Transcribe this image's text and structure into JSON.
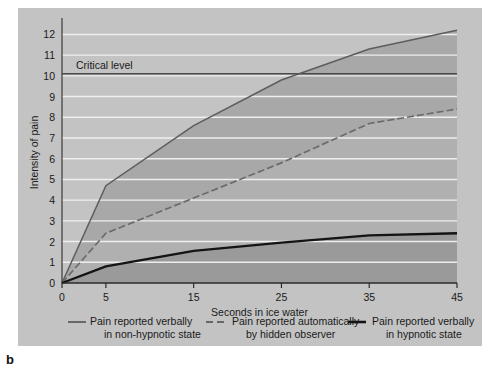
{
  "figure": {
    "panel_label": "b",
    "background_color": "#c3c3c3",
    "page_color": "#ffffff"
  },
  "chart_data": {
    "type": "area",
    "title": "",
    "xlabel": "Seconds in ice water",
    "ylabel": "Intensity of pain",
    "x": [
      0,
      5,
      15,
      25,
      35,
      45
    ],
    "xlim": [
      0,
      45
    ],
    "ylim": [
      0,
      12.6
    ],
    "xticks": [
      0,
      5,
      15,
      25,
      35,
      45
    ],
    "xtick_labels": [
      "0",
      "5",
      "15",
      "25",
      "35",
      "45"
    ],
    "yticks": [
      0,
      1,
      2,
      3,
      4,
      5,
      6,
      7,
      8,
      9,
      10,
      11,
      12
    ],
    "ytick_labels": [
      "0",
      "1",
      "2",
      "3",
      "4",
      "5",
      "6",
      "7",
      "8",
      "9",
      "10",
      "11",
      "12"
    ],
    "grid": true,
    "grid_color": "#f2f2f2",
    "legend_position": "below",
    "annotations": [
      {
        "name": "critical-level",
        "label": "Critical level",
        "y": 10.1,
        "style": "solid-horizontal-line"
      }
    ],
    "series": [
      {
        "name": "Pain reported verbally in non-hypnotic state",
        "values": [
          0.0,
          4.7,
          7.6,
          9.8,
          11.3,
          12.2
        ],
        "line_style": "solid",
        "line_color": "#5d5d5d",
        "band_color": "#a8a8a8"
      },
      {
        "name": "Pain reported automatically by hidden observer",
        "values": [
          0.0,
          2.4,
          4.1,
          5.8,
          7.7,
          8.4
        ],
        "line_style": "dashed",
        "line_color": "#6b6b6b",
        "band_color": "#b0b0b0"
      },
      {
        "name": "Pain reported verbally in hypnotic state",
        "values": [
          0.0,
          0.8,
          1.55,
          1.95,
          2.3,
          2.4
        ],
        "line_style": "solid-bold",
        "line_color": "#141414",
        "band_color": "#9a9a9a"
      }
    ]
  },
  "legend": [
    {
      "swatch": "solid-thin-line",
      "line1": "Pain reported verbally",
      "line2": "in non-hypnotic state"
    },
    {
      "swatch": "dashed-line",
      "line1": "Pain reported automatically",
      "line2": "by hidden observer"
    },
    {
      "swatch": "solid-bold-line",
      "line1": "Pain reported verbally",
      "line2": "in hypnotic state"
    }
  ]
}
